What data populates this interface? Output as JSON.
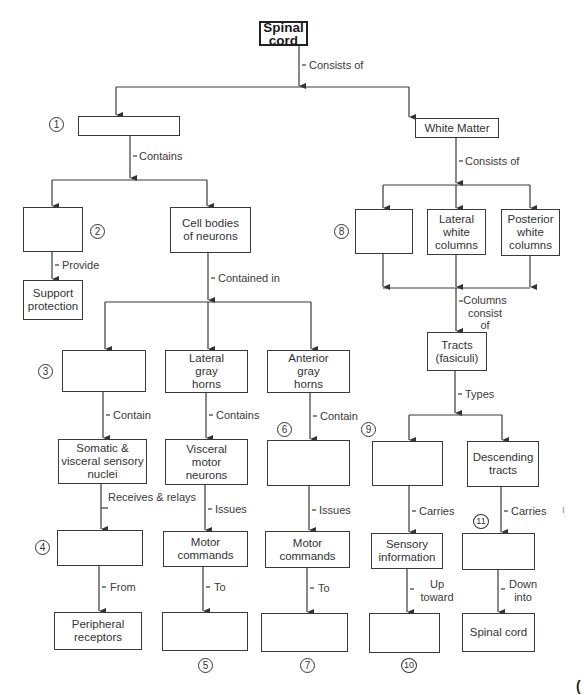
{
  "diagram": {
    "type": "concept-map",
    "root": {
      "label": "Spinal cord",
      "link": "Consists of"
    },
    "nodes": {
      "gray_matter": {
        "label": "",
        "number": "1",
        "link": "Contains"
      },
      "white_matter": {
        "label": "White Matter",
        "link": "Consists of"
      },
      "neuroglia": {
        "label": "",
        "number": "2",
        "link": "Provide"
      },
      "support": {
        "label": "Support protection"
      },
      "cell_bodies": {
        "label": "Cell bodies of neurons",
        "link": "Contained in"
      },
      "posterior_gray": {
        "label": "",
        "number": "3",
        "link": "Contain"
      },
      "lateral_gray": {
        "label": "Lateral gray horns",
        "link": "Contains"
      },
      "anterior_gray": {
        "label": "Anterior gray horns",
        "link": "Contain"
      },
      "sensory_nuclei": {
        "label": "Somatic & visceral sensory nuclei",
        "link": "Receives & relays"
      },
      "visceral_motor": {
        "label": "Visceral motor neurons",
        "link": "Issues"
      },
      "somatic_motor": {
        "label": "",
        "number": "6",
        "link": "Issues"
      },
      "sensory_info_in": {
        "label": "",
        "number": "4",
        "link": "From"
      },
      "motor_cmd_1": {
        "label": "Motor commands",
        "link": "To"
      },
      "motor_cmd_2": {
        "label": "Motor commands",
        "link": "To"
      },
      "peripheral": {
        "label": "Peripheral receptors"
      },
      "target_5": {
        "label": "",
        "number": "5"
      },
      "target_7": {
        "label": "",
        "number": "7"
      },
      "anterior_white": {
        "label": "",
        "number": "8"
      },
      "lateral_white": {
        "label": "Lateral white columns"
      },
      "posterior_white": {
        "label": "Posterior white columns"
      },
      "columns_link": {
        "link": "Columns consist of"
      },
      "tracts": {
        "label": "Tracts (fasiculi)",
        "link": "Types"
      },
      "ascending": {
        "label": "",
        "number": "9",
        "link": "Carries"
      },
      "descending": {
        "label": "Descending tracts",
        "link": "Carries"
      },
      "sensory_info": {
        "label": "Sensory information",
        "link": "Up toward"
      },
      "motor_11": {
        "label": "",
        "number": "11",
        "link": "Down into"
      },
      "target_10": {
        "label": "",
        "number": "10"
      },
      "spinal_cord_end": {
        "label": "Spinal cord"
      }
    }
  },
  "colors": {
    "line": "#3a3a3a",
    "text": "#333333",
    "background": "#ffffff"
  }
}
